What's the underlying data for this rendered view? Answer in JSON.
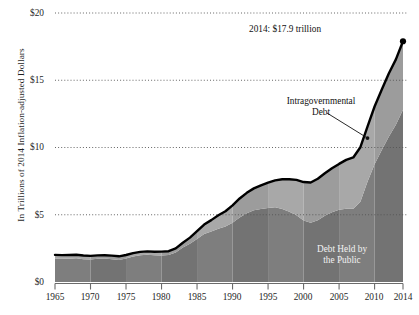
{
  "axes": {
    "ylabel": "In Trillions of 2014 Inflation-adjusted Dollars",
    "yticks": [
      "$0",
      "$5",
      "$10",
      "$15",
      "$20"
    ],
    "xticks": [
      "1965",
      "1970",
      "1975",
      "1980",
      "1985",
      "1990",
      "1995",
      "2000",
      "2005",
      "2010",
      "2014"
    ]
  },
  "annotations": {
    "peak": "2014: $17.9 trillion",
    "intragovernmental_line1": "Intragovernmental",
    "intragovernmental_line2": "Debt",
    "public_line1": "Debt Held by",
    "public_line2": "the Public"
  },
  "colors": {
    "total_line": "#000000",
    "intragovernmental_fill": "#a8a8a8",
    "intragovernmental_fill_alt": "#9c9c9c",
    "public_fill": "#7e7e7e",
    "public_fill_alt": "#737373",
    "gridline": "#555555",
    "axis": "#6b6b6b",
    "background": "#ffffff"
  },
  "chart_data": {
    "type": "area",
    "title": "",
    "subtitle": "",
    "xlabel": "",
    "ylabel": "In Trillions of 2014 Inflation-adjusted Dollars",
    "xlim": [
      1965,
      2014
    ],
    "ylim": [
      0,
      20
    ],
    "grid": true,
    "grid_axis": "y",
    "legend_position": "inline-annotation",
    "stacked": true,
    "value_unit": "trillions of 2014 inflation-adjusted dollars",
    "x": [
      1965,
      1966,
      1967,
      1968,
      1969,
      1970,
      1971,
      1972,
      1973,
      1974,
      1975,
      1976,
      1977,
      1978,
      1979,
      1980,
      1981,
      1982,
      1983,
      1984,
      1985,
      1986,
      1987,
      1988,
      1989,
      1990,
      1991,
      1992,
      1993,
      1994,
      1995,
      1996,
      1997,
      1998,
      1999,
      2000,
      2001,
      2002,
      2003,
      2004,
      2005,
      2006,
      2007,
      2008,
      2009,
      2010,
      2011,
      2012,
      2013,
      2014
    ],
    "series": [
      {
        "name": "Debt Held by the Public",
        "fill": "#7e7e7e",
        "values": [
          1.75,
          1.74,
          1.73,
          1.76,
          1.7,
          1.67,
          1.72,
          1.74,
          1.7,
          1.63,
          1.74,
          1.9,
          1.98,
          2.02,
          1.98,
          1.97,
          2.0,
          2.2,
          2.56,
          2.85,
          3.2,
          3.57,
          3.76,
          3.96,
          4.12,
          4.4,
          4.79,
          5.12,
          5.34,
          5.43,
          5.51,
          5.55,
          5.43,
          5.22,
          4.97,
          4.58,
          4.4,
          4.6,
          4.92,
          5.18,
          5.37,
          5.45,
          5.44,
          5.97,
          7.45,
          8.75,
          9.8,
          10.8,
          11.7,
          12.8
        ]
      },
      {
        "name": "Intragovernmental Debt",
        "fill": "#a8a8a8",
        "values": [
          0.27,
          0.26,
          0.28,
          0.27,
          0.27,
          0.27,
          0.26,
          0.25,
          0.26,
          0.28,
          0.27,
          0.25,
          0.26,
          0.26,
          0.27,
          0.29,
          0.29,
          0.3,
          0.36,
          0.45,
          0.58,
          0.7,
          0.84,
          1.0,
          1.14,
          1.3,
          1.42,
          1.51,
          1.62,
          1.76,
          1.88,
          2.01,
          2.21,
          2.42,
          2.62,
          2.85,
          3.0,
          3.08,
          3.16,
          3.27,
          3.41,
          3.63,
          3.82,
          4.05,
          4.1,
          4.3,
          4.5,
          4.7,
          4.85,
          5.1
        ]
      }
    ],
    "total": {
      "name": "Total Federal Debt",
      "line_color": "#000000",
      "values": [
        2.02,
        2.0,
        2.01,
        2.03,
        1.97,
        1.94,
        1.98,
        1.99,
        1.96,
        1.91,
        2.01,
        2.15,
        2.24,
        2.28,
        2.25,
        2.26,
        2.29,
        2.5,
        2.92,
        3.3,
        3.78,
        4.27,
        4.6,
        4.96,
        5.26,
        5.7,
        6.21,
        6.63,
        6.96,
        7.19,
        7.39,
        7.56,
        7.64,
        7.64,
        7.59,
        7.43,
        7.4,
        7.68,
        8.08,
        8.45,
        8.78,
        9.08,
        9.26,
        10.02,
        11.55,
        13.05,
        14.3,
        15.5,
        16.55,
        17.9
      ]
    },
    "endpoint": {
      "x": 2014,
      "y": 17.9,
      "label": "2014: $17.9 trillion"
    },
    "annotations": [
      {
        "text": "Intragovernmental Debt",
        "points_to_x": 2009,
        "points_to_y": 10.7
      },
      {
        "text": "Debt Held by the Public",
        "inside_series": "Debt Held by the Public"
      }
    ]
  }
}
